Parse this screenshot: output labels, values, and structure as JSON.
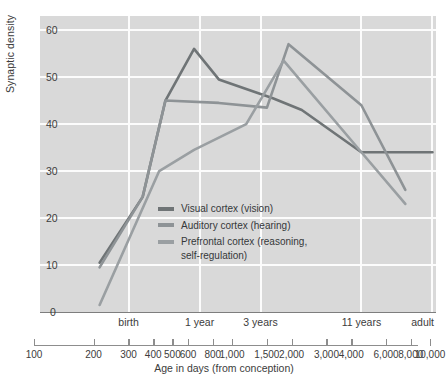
{
  "chart_data": {
    "type": "line",
    "title": "",
    "xlabel": "Age in days (from conception)",
    "ylabel": "Synaptic density",
    "xscale": "log",
    "xlim": [
      100,
      10000
    ],
    "ylim": [
      0,
      63
    ],
    "yticks": [
      0,
      10,
      20,
      30,
      40,
      50,
      60
    ],
    "ytick_labels": [
      "0",
      "10",
      "20",
      "30",
      "40",
      "50",
      "60"
    ],
    "xticks": [
      100,
      200,
      300,
      400,
      500,
      600,
      800,
      1000,
      1500,
      2000,
      3000,
      4000,
      6000,
      8000,
      10000
    ],
    "xtick_labels": [
      "100",
      "200",
      "300",
      "400",
      "500",
      "600",
      "800",
      "1,000",
      "1,500",
      "2,000",
      "3,000",
      "4,000",
      "6,000",
      "8,000",
      "10,000"
    ],
    "era_markers": [
      {
        "label": "birth",
        "x": 280
      },
      {
        "label": "1 year",
        "x": 640
      },
      {
        "label": "3 years",
        "x": 1300
      },
      {
        "label": "11 years",
        "x": 4200
      },
      {
        "label": "adult",
        "x": 9600
      }
    ],
    "grid": true,
    "grid_color": "#fcfcfc",
    "plot_background": "#d9d9d9",
    "legend_position": "inside-center-left",
    "series": [
      {
        "name": "Visual cortex (vision)",
        "color": "#6f7476",
        "x": [
          200,
          330,
          430,
          600,
          800,
          1500,
          2100,
          4200,
          9600
        ],
        "values": [
          10.5,
          24.5,
          45.0,
          56.0,
          49.5,
          45.5,
          43.0,
          34.0,
          34.0
        ]
      },
      {
        "name": "Auditory cortex (hearing)",
        "color": "#8e9396",
        "x": [
          200,
          330,
          430,
          800,
          1400,
          1800,
          4200,
          7000
        ],
        "values": [
          9.5,
          24.5,
          45.0,
          44.5,
          43.5,
          57.0,
          44.0,
          26.0
        ]
      },
      {
        "name": "Prefrontal cortex (reasoning, self-regulation)",
        "color": "#9a9fa2",
        "x": [
          200,
          400,
          600,
          1100,
          1700,
          4200,
          7000
        ],
        "values": [
          1.5,
          30.0,
          34.5,
          40.0,
          53.5,
          34.0,
          23.0
        ]
      }
    ]
  },
  "legend": {
    "items": [
      {
        "label": "Visual cortex (vision)",
        "color": "#6f7476"
      },
      {
        "label": "Auditory cortex (hearing)",
        "color": "#8e9396"
      },
      {
        "label": "Prefrontal cortex (reasoning,\nself-regulation)",
        "color": "#9a9fa2"
      }
    ]
  }
}
